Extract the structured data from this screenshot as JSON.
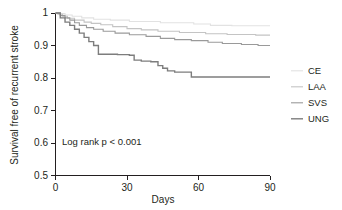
{
  "chart_data": {
    "type": "line",
    "title": "",
    "subtitle": "",
    "xlabel": "Days",
    "ylabel": "Survival free of recurrent stroke",
    "xlim": [
      0,
      90
    ],
    "ylim": [
      0.5,
      1.0
    ],
    "xticks": [
      0,
      30,
      60,
      90
    ],
    "xtick_labels": [
      "0",
      "30",
      "60",
      "90"
    ],
    "yticks": [
      0.5,
      0.6,
      0.7,
      0.8,
      0.9,
      1.0
    ],
    "ytick_labels": [
      "0.5",
      "0.6",
      "0.7",
      "0.8",
      "0.9",
      "1"
    ],
    "grid": false,
    "legend_position": "right",
    "annotation": "Log rank p < 0.001",
    "step_shape": "post",
    "series": [
      {
        "name": "CE",
        "color": "#e2e2e2",
        "width": 1.1,
        "x": [
          0,
          2,
          4,
          7,
          11,
          16,
          23,
          31,
          44,
          58,
          65,
          74,
          90
        ],
        "y": [
          1.0,
          0.998,
          0.994,
          0.99,
          0.985,
          0.981,
          0.978,
          0.974,
          0.97,
          0.966,
          0.962,
          0.961,
          0.961
        ]
      },
      {
        "name": "LAA",
        "color": "#c4c4c4",
        "width": 1.1,
        "x": [
          0,
          1,
          3,
          5,
          8,
          12,
          15,
          19,
          24,
          30,
          36,
          43,
          52,
          63,
          72,
          84,
          90
        ],
        "y": [
          1.0,
          0.996,
          0.99,
          0.984,
          0.978,
          0.972,
          0.968,
          0.964,
          0.958,
          0.952,
          0.948,
          0.944,
          0.94,
          0.936,
          0.934,
          0.932,
          0.932
        ]
      },
      {
        "name": "SVS",
        "color": "#9a9a9a",
        "width": 1.1,
        "x": [
          0,
          2,
          4,
          6,
          8,
          10,
          13,
          16,
          20,
          25,
          31,
          38,
          44,
          50,
          57,
          64,
          70,
          78,
          85,
          90
        ],
        "y": [
          1.0,
          0.992,
          0.985,
          0.978,
          0.97,
          0.962,
          0.955,
          0.95,
          0.944,
          0.938,
          0.933,
          0.928,
          0.922,
          0.918,
          0.915,
          0.91,
          0.906,
          0.903,
          0.9,
          0.9
        ]
      },
      {
        "name": "UNG",
        "color": "#7d7d7d",
        "width": 1.4,
        "x": [
          0,
          2,
          4,
          6,
          8,
          10,
          12,
          14,
          16,
          18,
          26,
          31,
          33,
          36,
          40,
          43,
          45,
          47,
          50,
          57,
          90
        ],
        "y": [
          1.0,
          0.985,
          0.972,
          0.962,
          0.95,
          0.938,
          0.925,
          0.912,
          0.9,
          0.873,
          0.872,
          0.87,
          0.855,
          0.852,
          0.85,
          0.838,
          0.83,
          0.822,
          0.818,
          0.803,
          0.803
        ]
      }
    ]
  },
  "legend": {
    "items": [
      {
        "label": "CE"
      },
      {
        "label": "LAA"
      },
      {
        "label": "SVS"
      },
      {
        "label": "UNG"
      }
    ]
  }
}
